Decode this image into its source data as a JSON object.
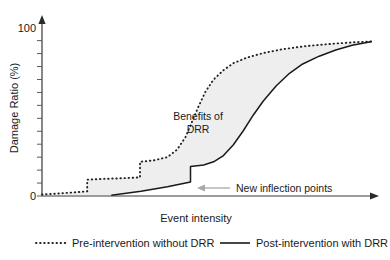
{
  "chart_data": {
    "type": "line",
    "title": "",
    "xlabel": "Event intensity",
    "ylabel": "Damage Ratio (%)",
    "ylim": [
      0,
      112
    ],
    "xlim": [
      0,
      100
    ],
    "grid": false,
    "y_tick_labels": [
      "100",
      "0"
    ],
    "y_tick_values": [
      100,
      0
    ],
    "x_tick_labels": [],
    "legend_position": "below-axes",
    "annotations": [
      {
        "name": "benefits-of-drr",
        "text_line1": "Benefits of",
        "text_line2": "DRR",
        "x": 44,
        "y": 47
      },
      {
        "name": "new-inflection-points",
        "text": "New inflection points",
        "x": 57,
        "y": 10
      }
    ],
    "shaded_region": {
      "label": "Benefits of DRR",
      "fill_color": "#eeeeee",
      "between": [
        "Pre-intervention without DRR",
        "Post-intervention with DRR"
      ]
    },
    "series": [
      {
        "name": "Pre-intervention without DRR",
        "style": "dotted",
        "color": "#222222",
        "x": [
          0,
          4,
          9,
          13.7,
          13.7,
          18,
          24,
          29.7,
          29.7,
          34,
          38,
          41,
          43.5,
          45.5,
          47.5,
          49.5,
          52,
          55,
          58,
          62,
          67,
          73,
          80,
          88,
          95,
          100
        ],
        "values": [
          1,
          1.5,
          2.2,
          3,
          10.5,
          11,
          11.4,
          12,
          22,
          23,
          25,
          30,
          38,
          48,
          58,
          67,
          75,
          81,
          85.5,
          89,
          92,
          94.5,
          96.5,
          98,
          99,
          99.5
        ]
      },
      {
        "name": "Post-intervention with DRR",
        "style": "solid",
        "color": "#1a1a1a",
        "x": [
          21,
          30,
          38,
          45,
          45,
          49,
          52,
          55,
          58,
          61,
          64,
          67,
          71,
          75,
          79,
          84,
          89,
          94,
          100
        ],
        "values": [
          0.5,
          3,
          6,
          9,
          19,
          20,
          22,
          26,
          33,
          42,
          52,
          61,
          71,
          79,
          85,
          90,
          94,
          97,
          99.5
        ]
      }
    ]
  },
  "axes": {
    "y_axis_label": "Damage Ratio (%)",
    "y_max_label": "100",
    "y_min_label": "0",
    "x_axis_label": "Event intensity"
  },
  "legend": {
    "items": [
      {
        "label": "Pre-intervention without DRR",
        "style": "dotted"
      },
      {
        "label": "Post-intervention with DRR",
        "style": "solid"
      }
    ]
  },
  "colors": {
    "line": "#1a1a1a",
    "axis": "#3a3a3a",
    "shade": "#eeeeee",
    "annotation_arrow": "#a8a8a8"
  }
}
